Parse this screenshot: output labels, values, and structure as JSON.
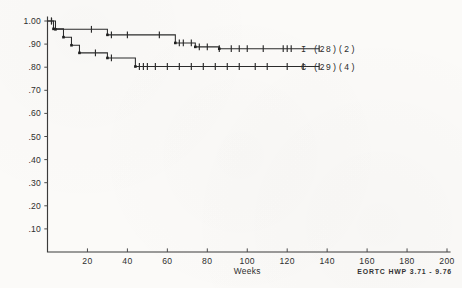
{
  "figure": {
    "background_color": "#fbfaf8",
    "ink_color": "#2b2b2b",
    "footer_note": "EORTC HWP 3.71 - 9.76"
  },
  "chart_data": {
    "type": "line",
    "title": "",
    "subtitle": "",
    "xlabel": "Weeks",
    "ylabel": "",
    "xlim": [
      0,
      200
    ],
    "ylim": [
      0,
      1.0
    ],
    "grid": false,
    "legend_position": "right-inline",
    "x_ticks": [
      20,
      40,
      60,
      80,
      100,
      120,
      140,
      160,
      180,
      200
    ],
    "x_tick_labels": [
      "20",
      "40",
      "60",
      "80",
      "100",
      "120",
      "140",
      "160",
      "180",
      "200"
    ],
    "y_ticks": [
      0.1,
      0.2,
      0.3,
      0.4,
      0.5,
      0.6,
      0.7,
      0.8,
      0.9,
      1.0
    ],
    "y_tick_labels": [
      ".10",
      ".20",
      ".30",
      ".40",
      ".50",
      ".60",
      ".70",
      ".80",
      ".90",
      "1.00"
    ],
    "annotations": [
      "EORTC HWP 3.71 - 9.76"
    ],
    "series": [
      {
        "name": "I (28)(2)",
        "legend_label": "I (28)(2)",
        "group_code": "I",
        "n_patients": 28,
        "n_events": 2,
        "plateau_value": 0.88,
        "final_x": 136,
        "step_points": [
          [
            0,
            1.0
          ],
          [
            4,
            1.0
          ],
          [
            4,
            0.964
          ],
          [
            30,
            0.964
          ],
          [
            30,
            0.94
          ],
          [
            64,
            0.94
          ],
          [
            64,
            0.905
          ],
          [
            74,
            0.905
          ],
          [
            74,
            0.888
          ],
          [
            86,
            0.888
          ],
          [
            86,
            0.88
          ],
          [
            136,
            0.88
          ]
        ],
        "censor_marks_x": [
          2,
          22,
          32,
          40,
          56,
          66,
          68,
          72,
          76,
          80,
          86,
          92,
          96,
          100,
          108,
          118,
          120,
          122,
          136
        ],
        "event_marks_x": [
          4,
          30,
          64,
          74,
          86
        ]
      },
      {
        "name": "C (29)(4)",
        "legend_label": "C (29)(4)",
        "group_code": "C",
        "n_patients": 29,
        "n_events": 4,
        "plateau_value": 0.803,
        "final_x": 136,
        "step_points": [
          [
            0,
            1.0
          ],
          [
            3,
            1.0
          ],
          [
            3,
            0.966
          ],
          [
            8,
            0.966
          ],
          [
            8,
            0.93
          ],
          [
            12,
            0.93
          ],
          [
            12,
            0.895
          ],
          [
            16,
            0.895
          ],
          [
            16,
            0.862
          ],
          [
            30,
            0.862
          ],
          [
            30,
            0.84
          ],
          [
            44,
            0.84
          ],
          [
            44,
            0.803
          ],
          [
            136,
            0.803
          ]
        ],
        "censor_marks_x": [
          2,
          24,
          32,
          46,
          48,
          50,
          54,
          60,
          66,
          72,
          78,
          84,
          90,
          96,
          104,
          110,
          120,
          128,
          136
        ],
        "event_marks_x": [
          3,
          8,
          12,
          16,
          30,
          44
        ]
      }
    ]
  }
}
